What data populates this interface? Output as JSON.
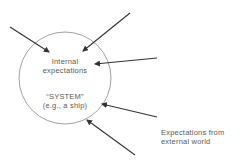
{
  "diagram": {
    "circle_label_top_line1": "Internal",
    "circle_label_top_line2": "expectations",
    "circle_label_bottom_line1": "“SYSTEM”",
    "circle_label_bottom_line2": "(e.g., a ship)",
    "external_label_line1": "Expectations from",
    "external_label_line2": "external world",
    "arrow_count": 5,
    "colors": {
      "line": "#333333",
      "circle": "#8a8a8a",
      "text": "#5a5a5a"
    }
  }
}
